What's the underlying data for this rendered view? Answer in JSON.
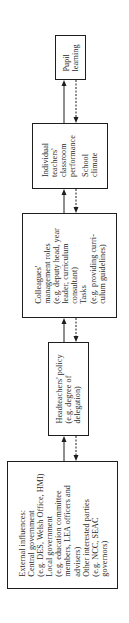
{
  "diagram": {
    "nodes": [
      {
        "id": "pupil",
        "lines": [
          "Pupil",
          "learning"
        ]
      },
      {
        "id": "teachers",
        "lines": [
          "Individual",
          "teachers'",
          "classroom",
          "performance",
          "School",
          "climate"
        ]
      },
      {
        "id": "colleagues",
        "lines": [
          "Colleagues'",
          "management roles",
          "(e.g. deputy head, year",
          "leader, curriculum",
          "consultant)",
          "Tasks",
          "(e.g. providing curri-",
          "culum guidelines)"
        ]
      },
      {
        "id": "headteachers",
        "lines": [
          "Headteachers' policy",
          "(e.g. degree of",
          "delegation)"
        ]
      },
      {
        "id": "external",
        "lines": [
          "External influences:",
          "Central government",
          "(e.g. DES, Welsh Office, HMI)",
          "Local government",
          "(e.g. education committee",
          "members, LEA officers and",
          "advisers)",
          "Other interested parties",
          "(e.g. NCC, SEAC",
          "governors)"
        ]
      }
    ],
    "edges": [
      {
        "from": "teachers",
        "to": "pupil",
        "style": "solid"
      },
      {
        "from": "pupil",
        "to": "teachers",
        "style": "dashed"
      },
      {
        "from": "colleagues",
        "to": "teachers",
        "style": "solid"
      },
      {
        "from": "teachers",
        "to": "colleagues",
        "style": "dashed"
      },
      {
        "from": "headteachers",
        "to": "colleagues",
        "style": "solid"
      },
      {
        "from": "colleagues",
        "to": "headteachers",
        "style": "dashed"
      },
      {
        "from": "external",
        "to": "headteachers",
        "style": "solid"
      },
      {
        "from": "headteachers",
        "to": "external",
        "style": "dashed"
      }
    ],
    "orientation": "rotated-90-ccw",
    "colors": {
      "line": "#1e1e1e",
      "text": "#2a2a2a",
      "background": "#ffffff"
    }
  }
}
